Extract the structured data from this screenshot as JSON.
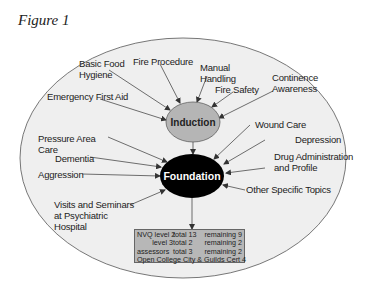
{
  "figure_title": "Figure 1",
  "nodes": {
    "induction": "Induction",
    "foundation": "Foundation"
  },
  "induction_inputs": [
    "Basic Food Hygiene",
    "Fire Procedure",
    "Manual Handling",
    "Fire Safety",
    "Continence Awareness",
    "Emergency First Aid"
  ],
  "foundation_inputs": [
    "Pressure Area Care",
    "Dementia",
    "Aggression",
    "Visits and Seminars at Psychiatric Hospital",
    "Wound Care",
    "Depression",
    "Drug Administration and Profile",
    "Other Specific Topics"
  ],
  "labels": {
    "basic_food_1": "Basic Food",
    "basic_food_2": "Hygiene",
    "fire_procedure": "Fire Procedure",
    "manual_1": "Manual",
    "manual_2": "Handling",
    "fire_safety": "Fire Safety",
    "continence_1": "Continence",
    "continence_2": "Awareness",
    "emergency": "Emergency First Aid",
    "pressure_1": "Pressure Area",
    "pressure_2": "Care",
    "dementia": "Dementia",
    "aggression": "Aggression",
    "visits_1": "Visits and Seminars",
    "visits_2": "at Psychiatric",
    "visits_3": "Hospital",
    "wound": "Wound Care",
    "depression": "Depression",
    "drug_1": "Drug Administration",
    "drug_2": "and Profile",
    "other": "Other Specific Topics"
  },
  "summary_box": {
    "rows": [
      {
        "a": "NVQ level 2",
        "b": "total 13",
        "c": "remaining 9"
      },
      {
        "a": "level 3",
        "b": "total  2",
        "c": "remaining 2"
      },
      {
        "a": "assessors",
        "b": "total  3",
        "c": "remaining 2"
      }
    ],
    "footer": "Open College City & Guilds Cert 4"
  },
  "colors": {
    "outer_oval": "#efefef",
    "induction_fill": "#b5b5b5",
    "foundation_fill": "#000000",
    "box_fill": "#b7b7b7"
  }
}
